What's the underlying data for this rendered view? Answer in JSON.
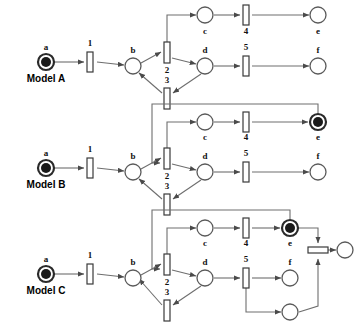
{
  "figure": {
    "type": "petri-net-diagram",
    "model_count": 3,
    "background_color": "#ffffff",
    "arc_color": "#6e6e6e",
    "token_color": "#1a1a1a",
    "place_stroke_color": "#5a5a5a",
    "transition_fill": "#ffffff"
  },
  "models": [
    {
      "id": "model-a",
      "name": "Model A",
      "places": [
        {
          "id": "a",
          "label": "a",
          "marked": true,
          "double_ring": true,
          "x": 46,
          "y": 62,
          "r": 8
        },
        {
          "id": "b",
          "label": "b",
          "marked": false,
          "double_ring": false,
          "x": 133,
          "y": 66,
          "r": 8
        },
        {
          "id": "c",
          "label": "c",
          "marked": false,
          "double_ring": false,
          "x": 205,
          "y": 15,
          "r": 8
        },
        {
          "id": "d",
          "label": "d",
          "marked": false,
          "double_ring": false,
          "x": 205,
          "y": 66,
          "r": 8
        },
        {
          "id": "e",
          "label": "e",
          "marked": false,
          "double_ring": false,
          "x": 318,
          "y": 15,
          "r": 8
        },
        {
          "id": "f",
          "label": "f",
          "marked": false,
          "double_ring": false,
          "x": 318,
          "y": 66,
          "r": 8
        }
      ],
      "transitions": [
        {
          "id": "t1",
          "label": "1",
          "x": 91,
          "y": 62,
          "orientation": "vertical"
        },
        {
          "id": "t2",
          "label": "2",
          "x": 167,
          "y": 57,
          "orientation": "vertical"
        },
        {
          "id": "t3",
          "label": "3",
          "x": 167,
          "y": 92,
          "orientation": "vertical"
        },
        {
          "id": "t4",
          "label": "4",
          "x": 246,
          "y": 15,
          "orientation": "vertical"
        },
        {
          "id": "t5",
          "label": "5",
          "x": 246,
          "y": 66,
          "orientation": "vertical"
        }
      ],
      "arcs": [
        {
          "from": "a",
          "to": "t1"
        },
        {
          "from": "t1",
          "to": "b"
        },
        {
          "from": "b",
          "to": "t2"
        },
        {
          "from": "t2",
          "to": "c"
        },
        {
          "from": "t2",
          "to": "d"
        },
        {
          "from": "c",
          "to": "t4"
        },
        {
          "from": "t4",
          "to": "e"
        },
        {
          "from": "d",
          "to": "t5"
        },
        {
          "from": "t5",
          "to": "f"
        },
        {
          "from": "d",
          "to": "t3"
        },
        {
          "from": "t3",
          "to": "b"
        }
      ]
    },
    {
      "id": "model-b",
      "name": "Model B",
      "places": [
        {
          "id": "a",
          "label": "a",
          "marked": true,
          "double_ring": true,
          "x": 46,
          "y": 168,
          "r": 8
        },
        {
          "id": "b",
          "label": "b",
          "marked": false,
          "double_ring": false,
          "x": 133,
          "y": 172,
          "r": 8
        },
        {
          "id": "c",
          "label": "c",
          "marked": false,
          "double_ring": false,
          "x": 205,
          "y": 122,
          "r": 8
        },
        {
          "id": "d",
          "label": "d",
          "marked": false,
          "double_ring": false,
          "x": 205,
          "y": 172,
          "r": 8
        },
        {
          "id": "e",
          "label": "e",
          "marked": true,
          "double_ring": true,
          "x": 318,
          "y": 122,
          "r": 8
        },
        {
          "id": "f",
          "label": "f",
          "marked": false,
          "double_ring": false,
          "x": 318,
          "y": 172,
          "r": 8
        }
      ],
      "transitions": [
        {
          "id": "t1",
          "label": "1",
          "x": 91,
          "y": 168,
          "orientation": "vertical"
        },
        {
          "id": "t2",
          "label": "2",
          "x": 167,
          "y": 163,
          "orientation": "vertical"
        },
        {
          "id": "t3",
          "label": "3",
          "x": 167,
          "y": 198,
          "orientation": "vertical"
        },
        {
          "id": "t4",
          "label": "4",
          "x": 246,
          "y": 122,
          "orientation": "vertical"
        },
        {
          "id": "t5",
          "label": "5",
          "x": 246,
          "y": 172,
          "orientation": "vertical"
        }
      ],
      "arcs": [
        {
          "from": "a",
          "to": "t1"
        },
        {
          "from": "t1",
          "to": "b"
        },
        {
          "from": "b",
          "to": "t2"
        },
        {
          "from": "t2",
          "to": "c"
        },
        {
          "from": "t2",
          "to": "d"
        },
        {
          "from": "c",
          "to": "t4"
        },
        {
          "from": "t4",
          "to": "e"
        },
        {
          "from": "d",
          "to": "t5"
        },
        {
          "from": "t5",
          "to": "f"
        },
        {
          "from": "d",
          "to": "t3"
        },
        {
          "from": "t3",
          "to": "b"
        },
        {
          "from": "e",
          "to": "t2",
          "style": "feedback-loop"
        }
      ]
    },
    {
      "id": "model-c",
      "name": "Model C",
      "places": [
        {
          "id": "a",
          "label": "a",
          "marked": true,
          "double_ring": true,
          "x": 46,
          "y": 274,
          "r": 8
        },
        {
          "id": "b",
          "label": "b",
          "marked": false,
          "double_ring": false,
          "x": 133,
          "y": 278,
          "r": 8
        },
        {
          "id": "c",
          "label": "c",
          "marked": false,
          "double_ring": false,
          "x": 205,
          "y": 228,
          "r": 8
        },
        {
          "id": "d",
          "label": "d",
          "marked": false,
          "double_ring": false,
          "x": 205,
          "y": 278,
          "r": 8
        },
        {
          "id": "e",
          "label": "e",
          "marked": true,
          "double_ring": true,
          "x": 290,
          "y": 228,
          "r": 8
        },
        {
          "id": "f",
          "label": "f",
          "marked": false,
          "double_ring": false,
          "x": 290,
          "y": 278,
          "r": 8
        },
        {
          "id": "g",
          "label": "",
          "marked": false,
          "double_ring": false,
          "x": 290,
          "y": 312,
          "r": 8
        },
        {
          "id": "h",
          "label": "",
          "marked": false,
          "double_ring": false,
          "x": 345,
          "y": 250,
          "r": 8
        }
      ],
      "transitions": [
        {
          "id": "t1",
          "label": "1",
          "x": 91,
          "y": 274,
          "orientation": "vertical"
        },
        {
          "id": "t2",
          "label": "2",
          "x": 167,
          "y": 269,
          "orientation": "vertical"
        },
        {
          "id": "t3",
          "label": "3",
          "x": 167,
          "y": 304,
          "orientation": "vertical"
        },
        {
          "id": "t4",
          "label": "4",
          "x": 246,
          "y": 228,
          "orientation": "vertical"
        },
        {
          "id": "t5",
          "label": "5",
          "x": 246,
          "y": 278,
          "orientation": "vertical"
        },
        {
          "id": "t6",
          "label": "",
          "x": 318,
          "y": 250,
          "orientation": "horizontal"
        }
      ],
      "arcs": [
        {
          "from": "a",
          "to": "t1"
        },
        {
          "from": "t1",
          "to": "b"
        },
        {
          "from": "b",
          "to": "t2"
        },
        {
          "from": "t2",
          "to": "c"
        },
        {
          "from": "t2",
          "to": "d"
        },
        {
          "from": "c",
          "to": "t4"
        },
        {
          "from": "t4",
          "to": "e"
        },
        {
          "from": "d",
          "to": "t5"
        },
        {
          "from": "t5",
          "to": "f"
        },
        {
          "from": "t5",
          "to": "g"
        },
        {
          "from": "d",
          "to": "t3"
        },
        {
          "from": "t3",
          "to": "b"
        },
        {
          "from": "e",
          "to": "t2",
          "style": "feedback-loop"
        },
        {
          "from": "e",
          "to": "t6"
        },
        {
          "from": "g",
          "to": "t6"
        },
        {
          "from": "t6",
          "to": "h"
        }
      ]
    }
  ]
}
